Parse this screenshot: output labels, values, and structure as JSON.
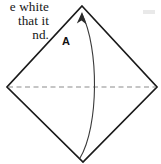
{
  "figure": {
    "kind": "origami-fold-diagram",
    "background_color": "#ffffff",
    "width": 161,
    "height": 164
  },
  "caption": {
    "name": "instruction-text",
    "cropped": true,
    "lines": [
      "e white",
      "that it",
      "nd."
    ]
  },
  "labels": {
    "region_a": "A"
  },
  "shape": {
    "name": "diamond-outline",
    "description": "square rotated 45 degrees",
    "stroke_color": "#1a1a1a",
    "stroke_width": 1.7,
    "fill": "none",
    "points": "82,6 157,87 83,162 7,87",
    "vertices": {
      "top": [
        82,
        6
      ],
      "right": [
        157,
        87
      ],
      "bottom": [
        83,
        162
      ],
      "left": [
        7,
        87
      ]
    }
  },
  "fold_line": {
    "name": "horizontal-fold-crease",
    "style": "dashed",
    "stroke_color": "#8c8c8c",
    "stroke_width": 1.2,
    "dash_pattern": "5,3.5",
    "from": [
      8,
      87
    ],
    "to": [
      156,
      87
    ]
  },
  "fold_arrow": {
    "name": "fold-direction-arrow",
    "stroke_color": "#3a3a3a",
    "stroke_width": 1.1,
    "path": "M 80 158 C 99 126, 99 48, 82 14",
    "arrowhead": {
      "points": "82,12 86,24 81.5,20.5 77,23",
      "fill": "#2b2b2b"
    },
    "direction": "bottom-vertex-to-top-vertex"
  },
  "stray_mark": {
    "name": "scan-artifact",
    "color": "#e9e9e9",
    "x": 143,
    "y": 10,
    "width": 12,
    "height": 4
  }
}
